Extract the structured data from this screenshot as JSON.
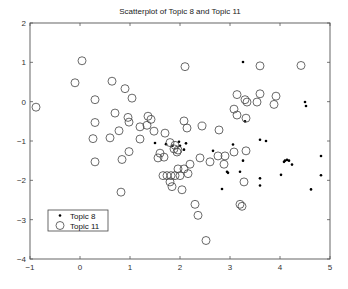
{
  "chart_data": {
    "type": "scatter",
    "title": "Scatterplot of Topic 8 and Topic 11",
    "xlabel": "",
    "ylabel": "",
    "xlim": [
      -1,
      5
    ],
    "ylim": [
      -4,
      2
    ],
    "xticks": [
      "-1",
      "0",
      "1",
      "2",
      "3",
      "4",
      "5"
    ],
    "yticks": [
      "2",
      "1",
      "0",
      "-1",
      "-2",
      "-3",
      "-4"
    ],
    "grid": false,
    "legend_position": "lower left",
    "series": [
      {
        "name": "Topic 8",
        "marker": "dot",
        "points": [
          [
            3.26,
            1.01
          ],
          [
            4.5,
            -0.01
          ],
          [
            4.52,
            -0.11
          ],
          [
            3.3,
            -0.5
          ],
          [
            1.98,
            -1.02
          ],
          [
            2.12,
            -1.06
          ],
          [
            3.6,
            -0.97
          ],
          [
            3.72,
            -1.0
          ],
          [
            2.66,
            -1.25
          ],
          [
            3.06,
            -1.09
          ],
          [
            3.26,
            -1.5
          ],
          [
            3.2,
            -1.78
          ],
          [
            2.94,
            -1.78
          ],
          [
            2.96,
            -1.81
          ],
          [
            2.84,
            -2.22
          ],
          [
            3.6,
            -1.95
          ],
          [
            3.6,
            -2.13
          ],
          [
            4.1,
            -1.5
          ],
          [
            4.14,
            -1.48
          ],
          [
            4.18,
            -1.5
          ],
          [
            4.08,
            -1.53
          ],
          [
            4.24,
            -1.6
          ],
          [
            4.02,
            -1.86
          ],
          [
            4.82,
            -1.38
          ],
          [
            4.82,
            -1.87
          ],
          [
            4.62,
            -2.23
          ],
          [
            1.5,
            -1.05
          ],
          [
            1.72,
            -1.08
          ],
          [
            2.0,
            -1.12
          ],
          [
            2.08,
            -1.22
          ],
          [
            1.85,
            -1.12
          ]
        ]
      },
      {
        "name": "Topic 11",
        "marker": "circle",
        "points": [
          [
            -0.88,
            -0.14
          ],
          [
            0.04,
            1.04
          ],
          [
            -0.1,
            0.48
          ],
          [
            0.3,
            0.05
          ],
          [
            0.64,
            0.52
          ],
          [
            0.9,
            0.33
          ],
          [
            1.04,
            0.09
          ],
          [
            0.3,
            -0.53
          ],
          [
            0.7,
            -0.29
          ],
          [
            0.96,
            -0.4
          ],
          [
            0.98,
            -0.52
          ],
          [
            1.2,
            -0.64
          ],
          [
            1.36,
            -0.37
          ],
          [
            1.42,
            -0.45
          ],
          [
            1.34,
            -0.6
          ],
          [
            1.48,
            -0.75
          ],
          [
            1.7,
            -0.8
          ],
          [
            2.14,
            -0.67
          ],
          [
            2.1,
            0.89
          ],
          [
            0.26,
            -0.94
          ],
          [
            0.6,
            -0.92
          ],
          [
            0.78,
            -0.74
          ],
          [
            0.3,
            -1.53
          ],
          [
            0.84,
            -1.47
          ],
          [
            0.98,
            -1.27
          ],
          [
            1.2,
            -0.95
          ],
          [
            1.8,
            -1.04
          ],
          [
            1.9,
            -1.11
          ],
          [
            1.96,
            -1.23
          ],
          [
            1.56,
            -1.43
          ],
          [
            1.68,
            -1.41
          ],
          [
            1.6,
            -1.31
          ],
          [
            1.88,
            -1.2
          ],
          [
            1.94,
            -1.28
          ],
          [
            1.66,
            -1.88
          ],
          [
            1.74,
            -1.88
          ],
          [
            1.82,
            -1.88
          ],
          [
            1.9,
            -1.88
          ],
          [
            2.0,
            -1.88
          ],
          [
            1.96,
            -1.71
          ],
          [
            2.08,
            -1.71
          ],
          [
            2.16,
            -1.83
          ],
          [
            1.84,
            -2.16
          ],
          [
            1.8,
            -2.04
          ],
          [
            2.04,
            -2.24
          ],
          [
            0.82,
            -2.3
          ],
          [
            2.3,
            -2.61
          ],
          [
            2.36,
            -2.89
          ],
          [
            2.52,
            -3.53
          ],
          [
            3.2,
            -2.61
          ],
          [
            3.24,
            -2.66
          ],
          [
            3.6,
            0.91
          ],
          [
            3.14,
            0.18
          ],
          [
            3.6,
            0.2
          ],
          [
            3.3,
            0.05
          ],
          [
            3.34,
            -0.01
          ],
          [
            3.54,
            -0.01
          ],
          [
            3.08,
            -0.19
          ],
          [
            3.14,
            -0.34
          ],
          [
            3.32,
            -0.42
          ],
          [
            2.08,
            -0.49
          ],
          [
            2.44,
            -0.62
          ],
          [
            2.78,
            -0.72
          ],
          [
            2.6,
            -1.53
          ],
          [
            2.76,
            -1.38
          ],
          [
            2.9,
            -1.38
          ],
          [
            3.08,
            -1.28
          ],
          [
            3.32,
            -1.25
          ],
          [
            2.88,
            -1.59
          ],
          [
            3.28,
            -2.04
          ],
          [
            2.4,
            -1.43
          ],
          [
            2.2,
            -1.59
          ],
          [
            4.42,
            0.92
          ],
          [
            3.92,
            0.14
          ],
          [
            3.88,
            -0.07
          ]
        ]
      }
    ]
  }
}
